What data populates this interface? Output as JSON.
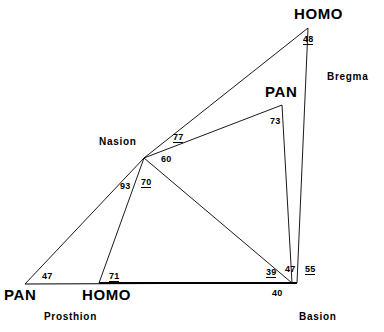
{
  "figure": {
    "type": "geometric-diagram"
  },
  "species_labels": [
    {
      "name": "homo-top",
      "text": "HOMO",
      "x": 294,
      "y": 6
    },
    {
      "name": "pan-middle",
      "text": "PAN",
      "x": 265,
      "y": 84
    },
    {
      "name": "pan-left",
      "text": "PAN",
      "x": 4,
      "y": 287
    },
    {
      "name": "homo-bottom",
      "text": "HOMO",
      "x": 82,
      "y": 287
    }
  ],
  "landmark_labels": [
    {
      "name": "nasion",
      "text": "Nasion",
      "x": 99,
      "y": 137
    },
    {
      "name": "bregma",
      "text": "Bregma",
      "x": 327,
      "y": 72
    },
    {
      "name": "basion",
      "text": "Basion",
      "x": 299,
      "y": 312
    },
    {
      "name": "prosthion",
      "text": "Prosthion",
      "x": 44,
      "y": 312
    }
  ],
  "angles": [
    {
      "name": "angle-48",
      "value": "48",
      "x": 303,
      "y": 35,
      "underlined": true
    },
    {
      "name": "angle-73",
      "value": "73",
      "x": 270,
      "y": 117,
      "underlined": false
    },
    {
      "name": "angle-77",
      "value": "77",
      "x": 173,
      "y": 133,
      "underlined": true
    },
    {
      "name": "angle-60",
      "value": "60",
      "x": 161,
      "y": 155,
      "underlined": false
    },
    {
      "name": "angle-93",
      "value": "93",
      "x": 120,
      "y": 182,
      "underlined": false
    },
    {
      "name": "angle-70",
      "value": "70",
      "x": 141,
      "y": 178,
      "underlined": true
    },
    {
      "name": "angle-47-left",
      "value": "47",
      "x": 42,
      "y": 272,
      "underlined": false
    },
    {
      "name": "angle-71",
      "value": "71",
      "x": 109,
      "y": 272,
      "underlined": true
    },
    {
      "name": "angle-39",
      "value": "39",
      "x": 266,
      "y": 268,
      "underlined": true
    },
    {
      "name": "angle-40",
      "value": "40",
      "x": 272,
      "y": 289,
      "underlined": false
    },
    {
      "name": "angle-47-right",
      "value": "47",
      "x": 285,
      "y": 265,
      "underlined": false
    },
    {
      "name": "angle-55",
      "value": "55",
      "x": 305,
      "y": 265,
      "underlined": true
    }
  ],
  "vertices": {
    "homo_apex": {
      "x": 308,
      "y": 28
    },
    "pan_apex": {
      "x": 282,
      "y": 105
    },
    "nasion": {
      "x": 144,
      "y": 158
    },
    "basion": {
      "x": 297,
      "y": 283
    },
    "pan_prosthion": {
      "x": 25,
      "y": 284
    },
    "homo_prosthion": {
      "x": 99,
      "y": 283
    }
  },
  "segments": [
    {
      "name": "homo-nasion-to-bregma",
      "x1": 144,
      "y1": 158,
      "x2": 308,
      "y2": 28,
      "width": 0.9
    },
    {
      "name": "homo-bregma-to-basion",
      "x1": 308,
      "y1": 28,
      "x2": 297,
      "y2": 283,
      "width": 0.9
    },
    {
      "name": "pan-nasion-to-bregma",
      "x1": 144,
      "y1": 158,
      "x2": 282,
      "y2": 105,
      "width": 0.9
    },
    {
      "name": "pan-bregma-to-basion",
      "x1": 282,
      "y1": 105,
      "x2": 292,
      "y2": 283,
      "width": 0.9
    },
    {
      "name": "pan-nasion-to-basion",
      "x1": 144,
      "y1": 158,
      "x2": 292,
      "y2": 283,
      "width": 0.9
    },
    {
      "name": "pan-nasion-to-prosthion",
      "x1": 144,
      "y1": 158,
      "x2": 25,
      "y2": 284,
      "width": 0.9
    },
    {
      "name": "homo-nasion-to-prosthion",
      "x1": 144,
      "y1": 158,
      "x2": 99,
      "y2": 283,
      "width": 0.9
    },
    {
      "name": "basal-line-pan",
      "x1": 25,
      "y1": 284,
      "x2": 297,
      "y2": 283,
      "width": 1.0
    },
    {
      "name": "basal-line-homo",
      "x1": 99,
      "y1": 283,
      "x2": 297,
      "y2": 283,
      "width": 2.0
    }
  ],
  "colors": {
    "line": "#000000",
    "text": "#000000",
    "background": "#ffffff"
  }
}
